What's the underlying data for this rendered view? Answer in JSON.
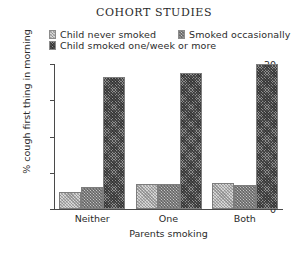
{
  "chart_data": {
    "type": "bar",
    "title": "COHORT STUDIES",
    "xlabel": "Parents smoking",
    "ylabel": "% cough first thing in morning",
    "categories": [
      "Neither",
      "One",
      "Both"
    ],
    "series": [
      {
        "name": "Child never smoked",
        "values": [
          2.4,
          3.5,
          3.6
        ]
      },
      {
        "name": "Smoked occasionally",
        "values": [
          3.0,
          3.4,
          3.3
        ]
      },
      {
        "name": "Child smoked one/week or more",
        "values": [
          18.2,
          18.7,
          20.0
        ]
      }
    ],
    "ylim": [
      0,
      20
    ],
    "yticks": [
      0,
      5,
      10,
      15,
      20
    ],
    "ytick_labels": [
      "0",
      "5",
      "10",
      "15",
      "20"
    ],
    "grid": false,
    "legend_position": "top",
    "colors": {
      "series_1": "#d7d7d7",
      "series_2": "#c9c9c9",
      "series_3": "#8e8e8e",
      "axis": "#4a4a4a",
      "text": "#2b2b2b",
      "background": "#ffffff"
    }
  }
}
